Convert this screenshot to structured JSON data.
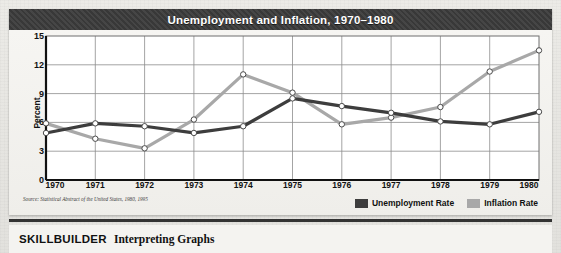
{
  "figure": {
    "title": "Unemployment and Inflation, 1970–1980",
    "source": "Source: Statistical Abstract of the United States, 1980, 1995"
  },
  "legend": {
    "items": [
      {
        "label": "Unemployment Rate",
        "color": "#3d3d3d"
      },
      {
        "label": "Inflation Rate",
        "color": "#a8a8a8"
      }
    ]
  },
  "footer": {
    "skillbuilder": "SKILLBUILDER",
    "subtitle": "Interpreting Graphs"
  },
  "chart_data": {
    "type": "line",
    "title": "Unemployment and Inflation, 1970–1980",
    "xlabel": "",
    "ylabel": "Percent",
    "categories": [
      "1970",
      "1971",
      "1972",
      "1973",
      "1974",
      "1975",
      "1976",
      "1977",
      "1978",
      "1979",
      "1980"
    ],
    "ylim": [
      0,
      15
    ],
    "yticks": [
      0,
      3,
      6,
      9,
      12,
      15
    ],
    "grid": true,
    "legend_position": "bottom-right",
    "series": [
      {
        "name": "Unemployment Rate",
        "color": "#3d3d3d",
        "values": [
          4.9,
          5.9,
          5.6,
          4.9,
          5.6,
          8.5,
          7.7,
          7.0,
          6.1,
          5.8,
          7.1
        ]
      },
      {
        "name": "Inflation Rate",
        "color": "#a8a8a8",
        "values": [
          5.9,
          4.3,
          3.3,
          6.3,
          11.0,
          9.1,
          5.8,
          6.5,
          7.6,
          11.3,
          13.5
        ]
      }
    ]
  }
}
